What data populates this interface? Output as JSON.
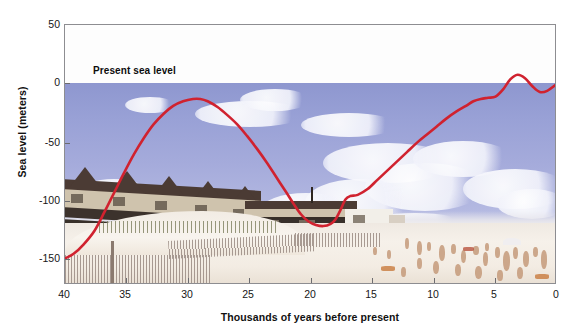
{
  "figure": {
    "background_color": "#ffffff",
    "curve_color": "#d0222f",
    "frame_color": "#8d8d91"
  },
  "annotations": {
    "present_sea_level": "Present sea level"
  },
  "chart_data": {
    "type": "line",
    "title": "",
    "subtitle": "",
    "xlabel": "Thousands of years before present",
    "ylabel": "Sea level (meters)",
    "xlim": [
      40,
      0
    ],
    "ylim": [
      -175,
      50
    ],
    "x_ticks": [
      40,
      35,
      30,
      25,
      20,
      15,
      10,
      5,
      0
    ],
    "x_tick_labels": [
      "40",
      "35",
      "30",
      "25",
      "20",
      "15",
      "10",
      "5",
      "0"
    ],
    "y_ticks": [
      50,
      0,
      -50,
      -100,
      -150
    ],
    "y_tick_labels": [
      "50",
      "0",
      "-50",
      "-100",
      "-150"
    ],
    "x_axis_reversed": true,
    "grid": false,
    "legend": null,
    "annotations": [
      {
        "text": "Present sea level",
        "x": 36.5,
        "y": 12
      }
    ],
    "series": [
      {
        "name": "Sea level",
        "color": "#d0222f",
        "units": "meters",
        "x": [
          40.0,
          39.3,
          38.5,
          37.6,
          36.8,
          36.0,
          35.2,
          34.4,
          33.6,
          32.8,
          32.0,
          31.2,
          30.4,
          29.6,
          29.0,
          28.4,
          27.6,
          26.8,
          26.0,
          25.2,
          24.4,
          23.6,
          22.8,
          22.0,
          21.4,
          20.8,
          20.2,
          19.6,
          19.0,
          18.4,
          18.0,
          17.6,
          17.2,
          16.8,
          16.2,
          15.4,
          14.6,
          13.8,
          13.0,
          12.2,
          11.4,
          10.6,
          9.8,
          9.0,
          8.2,
          7.4,
          6.8,
          6.2,
          5.6,
          5.0,
          4.4,
          3.8,
          3.2,
          2.6,
          2.0,
          1.4,
          0.8,
          0.0
        ],
        "y": [
          -152,
          -148,
          -140,
          -128,
          -112,
          -95,
          -78,
          -62,
          -48,
          -36,
          -27,
          -20,
          -16,
          -14,
          -14,
          -16,
          -21,
          -28,
          -36,
          -46,
          -57,
          -69,
          -82,
          -95,
          -105,
          -114,
          -120,
          -123,
          -124,
          -122,
          -118,
          -110,
          -101,
          -98,
          -97,
          -92,
          -84,
          -76,
          -68,
          -60,
          -52,
          -45,
          -38,
          -31,
          -25,
          -20,
          -16,
          -14,
          -13,
          -12,
          -6,
          3,
          7,
          4,
          -3,
          -8,
          -7,
          -1
        ]
      }
    ]
  },
  "axes": {
    "y_title": "Sea level (meters)",
    "x_title": "Thousands of years before present"
  },
  "photo": {
    "description": "beach-photograph-background",
    "sky_color": "#9aa3d6",
    "sand_color": "#f3ece3",
    "building_roof_color": "#4b3b34",
    "building_wall_color": "#cfc3ad"
  }
}
